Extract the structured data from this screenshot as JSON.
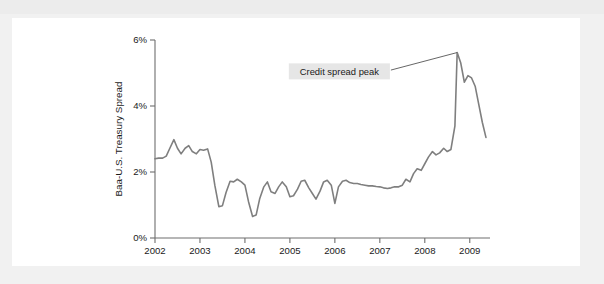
{
  "figure": {
    "background_color": "#ffffff",
    "page_background_color": "#f1f1f1",
    "line_color": "#7f7f7f",
    "axis_color": "#6e6e6e",
    "annotation_background_color": "#e6e6e6"
  },
  "chart_data": {
    "type": "line",
    "title": "",
    "subtitle": "",
    "xlabel": "",
    "ylabel": "Baa-U.S. Treasury Spread",
    "xlim": [
      2002.0,
      2009.45
    ],
    "ylim": [
      0,
      6
    ],
    "grid": false,
    "legend": null,
    "legend_position": "none",
    "y_tick_labels": [
      "0%",
      "2%",
      "4%",
      "6%"
    ],
    "y_tick_values": [
      0,
      2,
      4,
      6
    ],
    "x_tick_labels": [
      "2002",
      "2003",
      "2004",
      "2005",
      "2006",
      "2007",
      "2008",
      "2009"
    ],
    "x_tick_values": [
      2002,
      2003,
      2004,
      2005,
      2006,
      2007,
      2008,
      2009
    ],
    "annotations": [
      {
        "text": "Credit spread peak",
        "target_x": 2008.72,
        "target_y": 5.62,
        "box_x": 2006.1,
        "box_y": 5.05
      }
    ],
    "series": [
      {
        "name": "Baa-U.S. Treasury Spread",
        "color": "#7f7f7f",
        "x": [
          2002.0,
          2002.08,
          2002.17,
          2002.25,
          2002.33,
          2002.42,
          2002.5,
          2002.58,
          2002.67,
          2002.75,
          2002.83,
          2002.92,
          2003.0,
          2003.08,
          2003.17,
          2003.25,
          2003.33,
          2003.42,
          2003.5,
          2003.58,
          2003.67,
          2003.75,
          2003.83,
          2003.92,
          2004.0,
          2004.08,
          2004.17,
          2004.25,
          2004.33,
          2004.42,
          2004.5,
          2004.58,
          2004.67,
          2004.75,
          2004.83,
          2004.92,
          2005.0,
          2005.08,
          2005.17,
          2005.25,
          2005.33,
          2005.42,
          2005.5,
          2005.58,
          2005.67,
          2005.75,
          2005.83,
          2005.92,
          2006.0,
          2006.08,
          2006.17,
          2006.25,
          2006.33,
          2006.42,
          2006.5,
          2006.58,
          2006.67,
          2006.75,
          2006.83,
          2006.92,
          2007.0,
          2007.08,
          2007.17,
          2007.25,
          2007.33,
          2007.42,
          2007.5,
          2007.58,
          2007.67,
          2007.75,
          2007.83,
          2007.92,
          2008.0,
          2008.08,
          2008.17,
          2008.25,
          2008.33,
          2008.42,
          2008.5,
          2008.58,
          2008.67,
          2008.72,
          2008.8,
          2008.88,
          2008.96,
          2009.04,
          2009.12,
          2009.2,
          2009.28,
          2009.36
        ],
        "values": [
          2.4,
          2.42,
          2.42,
          2.48,
          2.72,
          2.98,
          2.72,
          2.55,
          2.72,
          2.8,
          2.62,
          2.55,
          2.68,
          2.66,
          2.7,
          2.3,
          1.6,
          0.95,
          0.98,
          1.38,
          1.72,
          1.7,
          1.78,
          1.7,
          1.6,
          1.1,
          0.65,
          0.7,
          1.2,
          1.55,
          1.7,
          1.4,
          1.35,
          1.55,
          1.7,
          1.55,
          1.25,
          1.28,
          1.48,
          1.72,
          1.75,
          1.52,
          1.35,
          1.18,
          1.42,
          1.7,
          1.75,
          1.6,
          1.05,
          1.55,
          1.72,
          1.75,
          1.68,
          1.65,
          1.65,
          1.62,
          1.6,
          1.58,
          1.58,
          1.56,
          1.55,
          1.52,
          1.5,
          1.52,
          1.55,
          1.55,
          1.6,
          1.78,
          1.7,
          1.95,
          2.1,
          2.05,
          2.25,
          2.45,
          2.62,
          2.52,
          2.58,
          2.72,
          2.62,
          2.68,
          3.4,
          5.62,
          5.3,
          4.72,
          4.92,
          4.85,
          4.6,
          4.05,
          3.5,
          3.05
        ]
      }
    ]
  }
}
